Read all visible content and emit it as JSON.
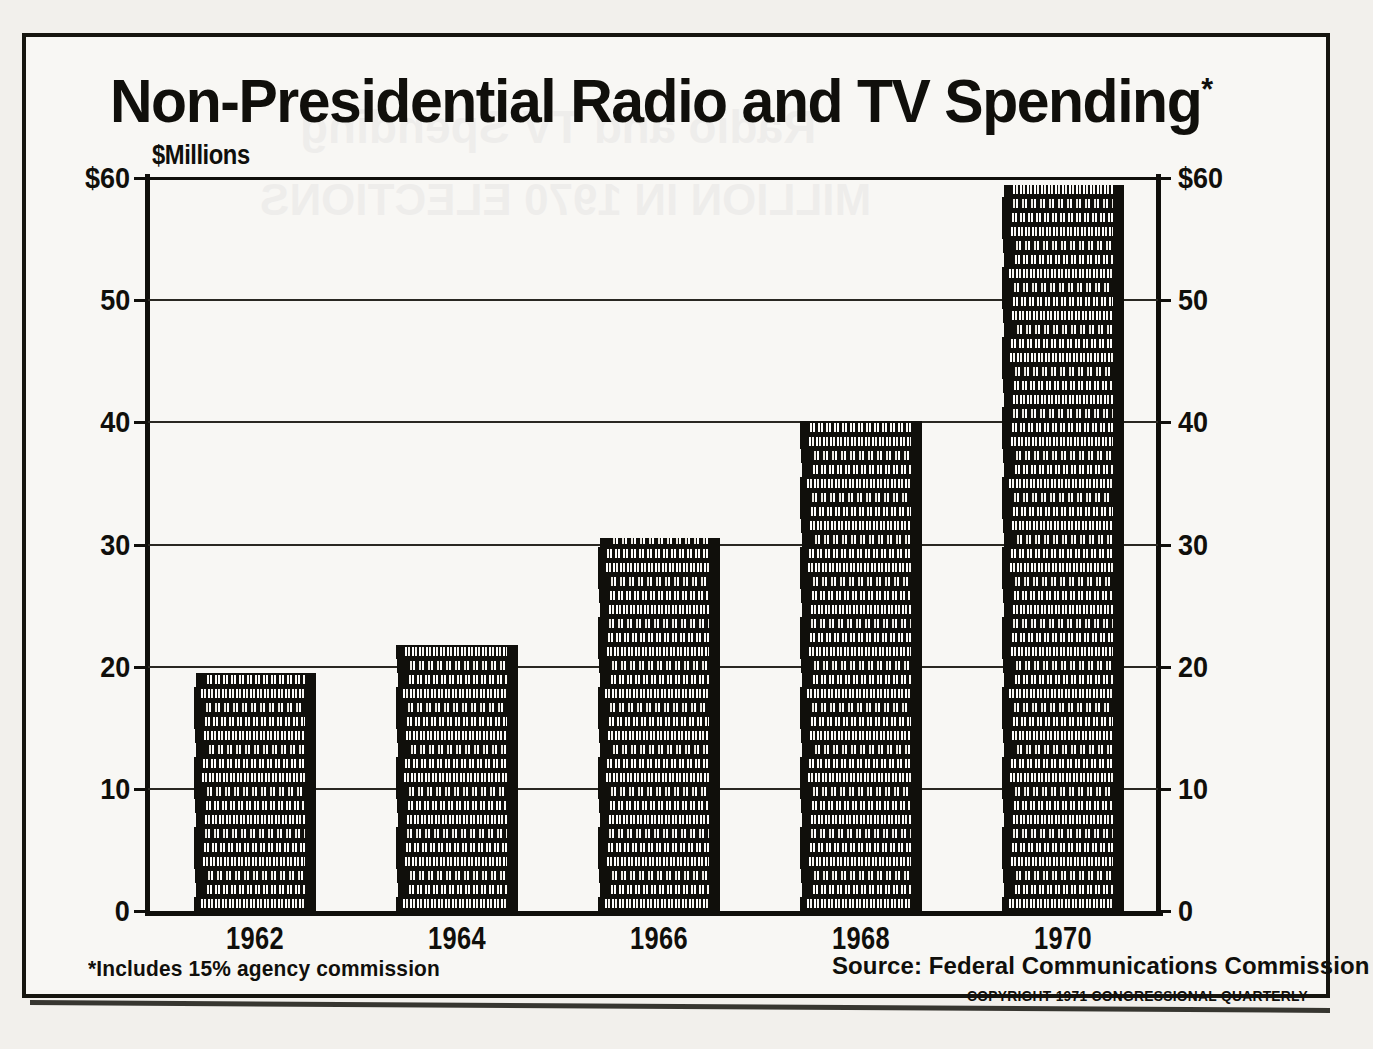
{
  "chart_data": {
    "type": "bar",
    "title": "Non-Presidential Radio and TV Spending*",
    "title_main": "Non-Presidential Radio and TV Spending",
    "title_asterisk": "*",
    "xlabel": "",
    "ylabel": "$Millions",
    "categories": [
      "1962",
      "1964",
      "1966",
      "1968",
      "1970"
    ],
    "values": [
      20.0,
      22.2,
      30.5,
      40.3,
      59.4
    ],
    "ylim": [
      0,
      60
    ],
    "ytick_values": [
      60,
      50,
      40,
      30,
      20,
      10,
      0
    ],
    "ytick_labels_left": [
      "$60",
      "50",
      "40",
      "30",
      "20",
      "10",
      "0"
    ],
    "ytick_labels_right": [
      "$60",
      "50",
      "40",
      "30",
      "20",
      "10",
      "0"
    ],
    "grid": true,
    "legend": "none",
    "series": [
      {
        "name": "Non-Presidential Radio and TV Spending",
        "values": [
          20.0,
          22.2,
          30.5,
          40.3,
          59.4
        ]
      }
    ],
    "annotations": [
      "*Includes 15% agency commission",
      "Source:  Federal Communications Commission",
      "COPYRIGHT 1971 CONGRESSIONAL QUARTERLY"
    ],
    "bar_style": "stacked-coins"
  },
  "notes": {
    "footnote": "*Includes 15% agency commission",
    "source": "Source:  Federal Communications Commission",
    "copyright": "COPYRIGHT 1971 CONGRESSIONAL QUARTERLY"
  },
  "colors": {
    "ink": "#100f0b",
    "paper": "#f2f0ec",
    "grid": "#2a2822"
  },
  "ghost": {
    "lines": [
      "Radio and TV Spending",
      "MILLION IN 1970 ELECTIONS"
    ]
  }
}
